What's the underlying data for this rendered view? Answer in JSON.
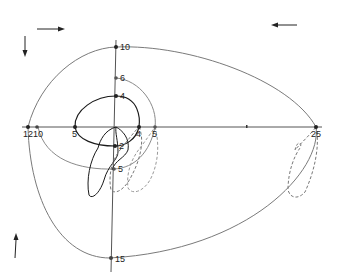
{
  "diagram": {
    "type": "trajectory-plot",
    "colors": {
      "background": "#ffffff",
      "axis": "#555555",
      "outer_curve": "#7a7a7a",
      "middle_curve": "#8a8a8a",
      "inner_curve": "#1a1a1a",
      "dashed_loops": "#777777",
      "points": "#222222",
      "arrows": "#222222"
    },
    "arrows": [
      {
        "id": "top-right",
        "direction": "right",
        "x": 38,
        "y": 29
      },
      {
        "id": "top-left-corner",
        "direction": "left",
        "x": 297,
        "y": 25
      },
      {
        "id": "left-down",
        "direction": "down",
        "x": 25,
        "y": 44
      },
      {
        "id": "bottom-left-up",
        "direction": "up",
        "x": 15,
        "y": 250
      }
    ],
    "vertical_axis_labels": [
      {
        "label": "10",
        "x": 115,
        "y": 47
      },
      {
        "label": "6",
        "x": 115,
        "y": 78
      },
      {
        "label": "4",
        "x": 115,
        "y": 96
      },
      {
        "label": "2",
        "x": 115,
        "y": 146
      },
      {
        "label": "5",
        "x": 115,
        "y": 169
      },
      {
        "label": "15",
        "x": 112,
        "y": 259
      }
    ],
    "horizontal_axis_labels": [
      {
        "label": "12",
        "x": 28,
        "y": 128
      },
      {
        "label": "10",
        "x": 37,
        "y": 128
      },
      {
        "label": "5",
        "x": 74,
        "y": 128
      },
      {
        "label": "4",
        "x": 139,
        "y": 128
      },
      {
        "label": "5",
        "x": 155,
        "y": 128
      },
      {
        "label": "25",
        "x": 316,
        "y": 128
      }
    ],
    "axis_tick_mark": {
      "x": 247,
      "y": 126
    }
  }
}
